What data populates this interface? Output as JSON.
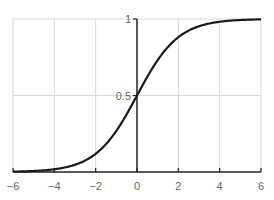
{
  "chart_data": {
    "type": "line",
    "title": "",
    "xlabel": "",
    "ylabel": "",
    "xlim": [
      -6,
      6
    ],
    "ylim": [
      0,
      1
    ],
    "grid": true,
    "x_ticks": [
      "−6",
      "−4",
      "−2",
      "0",
      "2",
      "4",
      "6"
    ],
    "y_ticks": [
      "0.5",
      "1"
    ],
    "series": [
      {
        "name": "sigmoid",
        "function": "1/(1+exp(-x))",
        "x": [
          -6,
          -5,
          -4,
          -3,
          -2,
          -1,
          0,
          1,
          2,
          3,
          4,
          5,
          6
        ],
        "values": [
          0.002,
          0.007,
          0.018,
          0.047,
          0.119,
          0.269,
          0.5,
          0.731,
          0.881,
          0.953,
          0.982,
          0.993,
          0.998
        ]
      }
    ],
    "colors": {
      "curve": "#1a1a1a",
      "grid": "#d8d8d8",
      "axis": "#222222",
      "tick_text": "#666666"
    }
  }
}
